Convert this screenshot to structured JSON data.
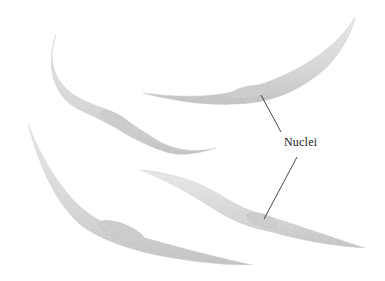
{
  "figure": {
    "label": "Nuclei",
    "cell_count": 4,
    "pointer_lines": 2
  },
  "colors": {
    "background": "#ffffff",
    "cell_fill": "#e4e4e4",
    "cell_shade": "#c9c9c9",
    "nucleus": "#d2d2d2",
    "line": "#333333",
    "text": "#1a1a1a"
  }
}
